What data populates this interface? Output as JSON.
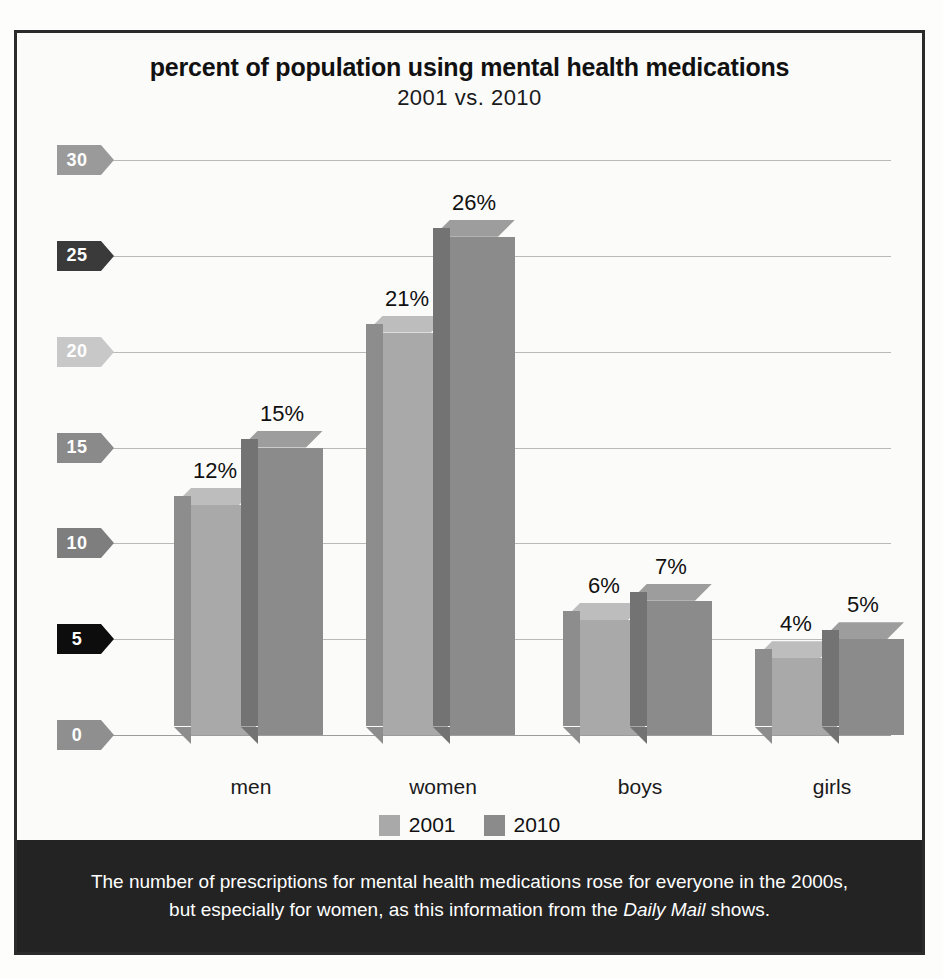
{
  "chart_data": {
    "type": "bar",
    "title": "percent of population using mental health medications",
    "subtitle": "2001 vs. 2010",
    "xlabel": "",
    "ylabel": "",
    "categories": [
      "men",
      "women",
      "boys",
      "girls"
    ],
    "series": [
      {
        "name": "2001",
        "values": [
          12,
          21,
          6,
          4
        ],
        "color": "#a9a9a9"
      },
      {
        "name": "2010",
        "values": [
          15,
          26,
          7,
          5
        ],
        "color": "#8b8b8b"
      }
    ],
    "data_labels": [
      [
        "12%",
        "15%"
      ],
      [
        "21%",
        "26%"
      ],
      [
        "6%",
        "7%"
      ],
      [
        "4%",
        "5%"
      ]
    ],
    "ylim": [
      0,
      30
    ],
    "yticks": [
      0,
      5,
      10,
      15,
      20,
      25,
      30
    ],
    "ytick_labels": [
      "0",
      "5",
      "10",
      "15",
      "20",
      "25",
      "30"
    ],
    "ytick_colors": [
      "#8f8f8f",
      "#0d0d0d",
      "#7e7e7e",
      "#8a8a8a",
      "#c8c8c8",
      "#3a3a3a",
      "#9a9a9a"
    ],
    "grid": true,
    "legend_position": "bottom"
  },
  "caption": {
    "line1": "The number of prescriptions for mental health medications rose for everyone in the 2000s,",
    "line2_pre": "but especially for women, as this information from the ",
    "line2_em": "Daily Mail",
    "line2_post": " shows."
  },
  "colors": {
    "border": "#2b2b2b",
    "caption_bg": "#232323",
    "gridline": "#b9b9b9",
    "bar_2001_face": "#a9a9a9",
    "bar_2001_side": "#8d8d8d",
    "bar_2001_top": "#bdbdbd",
    "bar_2010_face": "#8b8b8b",
    "bar_2010_side": "#737373",
    "bar_2010_top": "#9d9d9d"
  }
}
